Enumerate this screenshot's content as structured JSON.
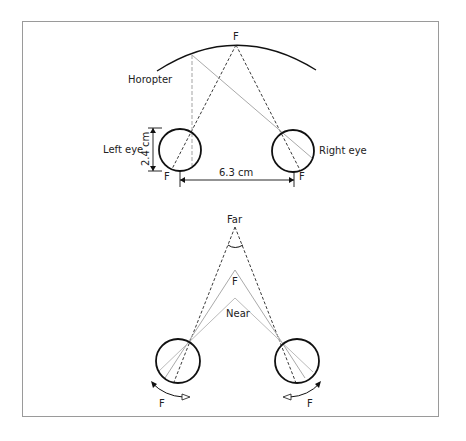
{
  "top_diagram": {
    "fixation_label": "F",
    "horopter_label": "Horopter",
    "left_eye_label": "Left eye",
    "right_eye_label": "Right eye",
    "eye_diameter_label": "2.4 cm",
    "interocular_distance_label": "6.3 cm",
    "left_fovea_label": "F",
    "right_fovea_label": "F"
  },
  "bottom_diagram": {
    "far_label": "Far",
    "fixation_label": "F",
    "near_label": "Near",
    "left_fovea_label": "F",
    "right_fovea_label": "F"
  },
  "colors": {
    "line": "#111111",
    "gray_line": "#aaaaaa",
    "frame": "#9a9a9a"
  }
}
